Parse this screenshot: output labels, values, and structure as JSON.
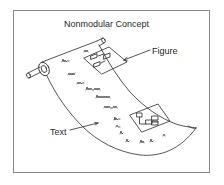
{
  "diagram": {
    "title": "Nonmodular Concept",
    "labels": {
      "figure": "Figure",
      "text": "Text"
    },
    "elements": [
      {
        "id": "scroll-roller",
        "kind": "cylinder",
        "description": "roller at upper left holding the scroll"
      },
      {
        "id": "scroll-sheet",
        "kind": "curved-sheet",
        "description": "long unrolled sheet with text lines and embedded figures"
      },
      {
        "id": "figure-top",
        "kind": "block-diagram",
        "description": "small block diagram embedded near top of scroll"
      },
      {
        "id": "figure-bottom",
        "kind": "block-diagram",
        "description": "small block diagram embedded near bottom of scroll"
      }
    ],
    "callouts": [
      {
        "label": "Figure",
        "points_to": "figure-top"
      },
      {
        "label": "Text",
        "points_to": "scroll-sheet"
      }
    ],
    "colors": {
      "ink": "#2a2a2a",
      "frame": "#8a8a8a",
      "background": "#ffffff"
    }
  }
}
